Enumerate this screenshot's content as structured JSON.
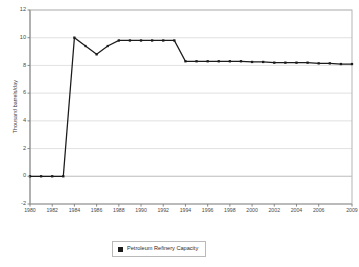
{
  "chart_data": {
    "type": "line",
    "title": "",
    "subtitle": "",
    "xlabel": "Year",
    "ylabel": "Thousand barrels/day",
    "ylim": [
      -2,
      12
    ],
    "xlim": [
      1980,
      2009
    ],
    "yticks": [
      12,
      10,
      8,
      6,
      4,
      2,
      0,
      -2
    ],
    "ytick_labels": [
      "12",
      "10",
      "8",
      "6",
      "4",
      "2",
      "0",
      "-2"
    ],
    "xticks": [
      1980,
      1982,
      1984,
      1986,
      1988,
      1990,
      1992,
      1994,
      1996,
      1998,
      2000,
      2002,
      2004,
      2006,
      2009
    ],
    "xtick_labels": [
      "1980",
      "1982",
      "1984",
      "1986",
      "1988",
      "1990",
      "1992",
      "1994",
      "1996",
      "1998",
      "2000",
      "2002",
      "2004",
      "2006",
      "2009"
    ],
    "grid": "horizontal",
    "legend_position": "bottom",
    "marker": "square",
    "line_color": "#1b1b1b",
    "grid_color": "#d9d9d9",
    "border_color": "#b5b5b5",
    "series": [
      {
        "name": "Petroleum Refinery Capacity",
        "x": [
          1980,
          1981,
          1982,
          1983,
          1984,
          1985,
          1986,
          1987,
          1988,
          1989,
          1990,
          1991,
          1992,
          1993,
          1994,
          1995,
          1996,
          1997,
          1998,
          1999,
          2000,
          2001,
          2002,
          2003,
          2004,
          2005,
          2006,
          2007,
          2008,
          2009
        ],
        "values": [
          0,
          0,
          0,
          0,
          10.0,
          9.4,
          8.8,
          9.4,
          9.8,
          9.8,
          9.8,
          9.8,
          9.8,
          9.8,
          8.3,
          8.3,
          8.3,
          8.3,
          8.3,
          8.3,
          8.25,
          8.25,
          8.2,
          8.2,
          8.2,
          8.2,
          8.15,
          8.15,
          8.1,
          8.1
        ]
      }
    ]
  },
  "axis": {
    "y_title": "Thousand barrels/day",
    "x_title": "Year"
  },
  "legend": {
    "entries": [
      {
        "label": "Petroleum Refinery Capacity",
        "color": "#1b1b1b",
        "marker": "square-marker"
      }
    ]
  }
}
